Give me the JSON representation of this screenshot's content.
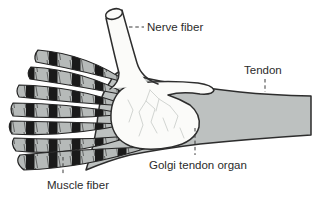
{
  "diagram": {
    "labels": {
      "nerve_fiber": "Nerve fiber",
      "tendon": "Tendon",
      "golgi_tendon_organ": "Golgi tendon organ",
      "muscle_fiber": "Muscle fiber"
    },
    "colors": {
      "background": "#ffffff",
      "tendon_gray": "#bdc1c0",
      "muscle_gray": "#b6bab9",
      "striation_black": "#1a1a1a",
      "outline": "#2d2d2d",
      "organ_white": "#fbfbf9",
      "nerve_branch_gray": "#d2d5d2",
      "label_text": "#2b2b2b"
    }
  }
}
